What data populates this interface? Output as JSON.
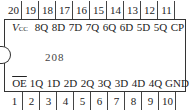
{
  "chip": {
    "part_number": "208",
    "top_pins": [
      {
        "number": "20",
        "label": "V",
        "label_sub": "CC"
      },
      {
        "number": "19",
        "label": "8Q"
      },
      {
        "number": "18",
        "label": "8D"
      },
      {
        "number": "17",
        "label": "7D"
      },
      {
        "number": "16",
        "label": "7Q"
      },
      {
        "number": "15",
        "label": "6Q"
      },
      {
        "number": "14",
        "label": "6D"
      },
      {
        "number": "13",
        "label": "5D"
      },
      {
        "number": "12",
        "label": "5Q"
      },
      {
        "number": "11",
        "label": "CP"
      }
    ],
    "bottom_pins": [
      {
        "number": "1",
        "label": "OE",
        "overline": true
      },
      {
        "number": "2",
        "label": "1Q"
      },
      {
        "number": "3",
        "label": "1D"
      },
      {
        "number": "4",
        "label": "2D"
      },
      {
        "number": "5",
        "label": "2Q"
      },
      {
        "number": "6",
        "label": "3Q"
      },
      {
        "number": "7",
        "label": "3D"
      },
      {
        "number": "8",
        "label": "4D"
      },
      {
        "number": "9",
        "label": "4Q"
      },
      {
        "number": "10",
        "label": "GND"
      }
    ]
  }
}
